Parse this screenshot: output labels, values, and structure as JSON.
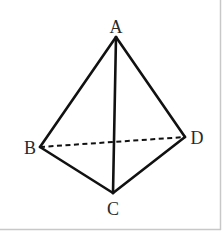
{
  "diagram": {
    "type": "tetrahedron",
    "vertices": [
      {
        "id": "A",
        "label": "A",
        "x": 116,
        "y": 37
      },
      {
        "id": "B",
        "label": "B",
        "x": 40,
        "y": 147
      },
      {
        "id": "C",
        "label": "C",
        "x": 113,
        "y": 193
      },
      {
        "id": "D",
        "label": "D",
        "x": 185,
        "y": 137
      }
    ],
    "edges": [
      {
        "from": "A",
        "to": "B",
        "style": "solid"
      },
      {
        "from": "A",
        "to": "C",
        "style": "solid"
      },
      {
        "from": "A",
        "to": "D",
        "style": "solid"
      },
      {
        "from": "B",
        "to": "C",
        "style": "solid"
      },
      {
        "from": "C",
        "to": "D",
        "style": "solid"
      },
      {
        "from": "B",
        "to": "D",
        "style": "dashed"
      }
    ],
    "labels": {
      "A": "A",
      "B": "B",
      "C": "C",
      "D": "D"
    },
    "colors": {
      "stroke": "#111111",
      "label": "#2a2a2a",
      "border": "#c8c8c8",
      "background": "#ffffff"
    }
  }
}
